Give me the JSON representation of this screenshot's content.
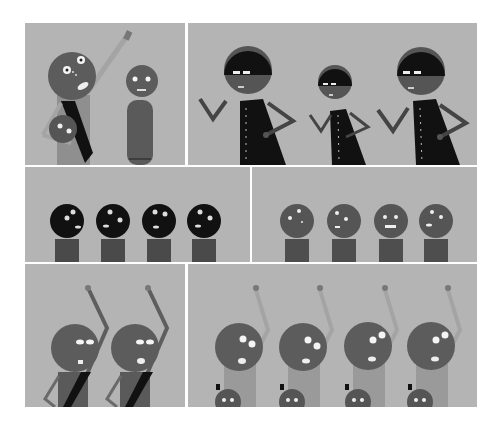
{
  "page": {
    "type": "comic-strip",
    "background": "#ffffff",
    "panel_background": "#b4b4b4",
    "colors": {
      "skin": "#5c5c5c",
      "skin_dark": "#4e4e4e",
      "black": "#111111",
      "light_body": "#9a9a9a",
      "arm_light": "#a4a4a4",
      "eye_white": "#f4f4f4"
    }
  },
  "panels": [
    {
      "id": "panel-1",
      "row": 1,
      "description": "Adult figure with raised arm carrying baby in sling, next to standing figure"
    },
    {
      "id": "panel-2",
      "row": 1,
      "description": "Three masked figures in black coats with frogged buttons, hands on hips"
    },
    {
      "id": "panel-3",
      "row": 2,
      "description": "Four black-headed figures with startled faces"
    },
    {
      "id": "panel-4",
      "row": 2,
      "description": "Four gray-headed figures with startled faces"
    },
    {
      "id": "panel-5",
      "row": 3,
      "description": "Two figures with raised fists, black sashes"
    },
    {
      "id": "panel-6",
      "row": 3,
      "description": "Four figures with raised fists carrying babies"
    }
  ]
}
